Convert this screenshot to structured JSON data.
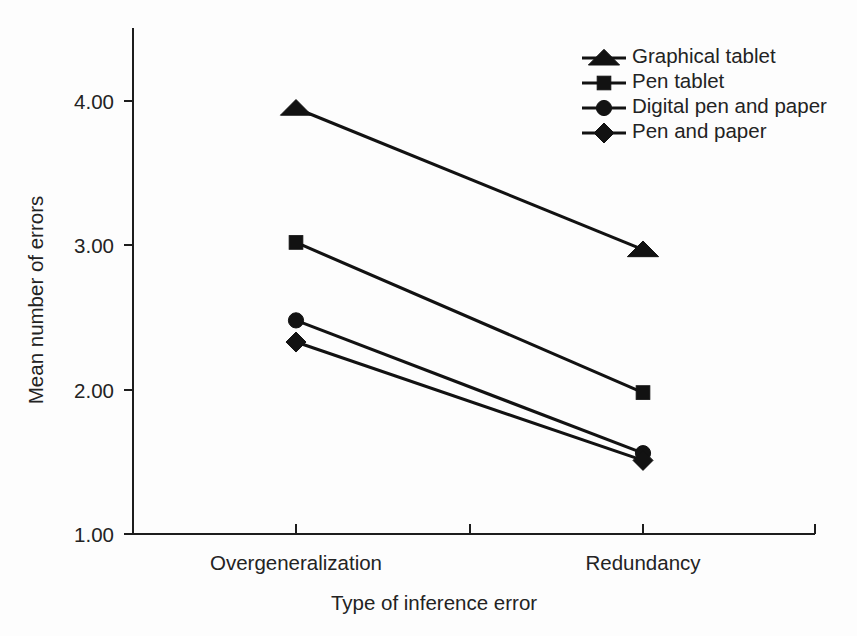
{
  "chart_data": {
    "type": "line",
    "title": "",
    "xlabel": "Type of inference error",
    "ylabel": "Mean number of errors",
    "categories": [
      "Overgeneralization",
      "Redundancy"
    ],
    "ylim": [
      1.0,
      4.3
    ],
    "yticks": [
      "1.00",
      "2.00",
      "3.00",
      "4.00"
    ],
    "ytick_values": [
      1.0,
      2.0,
      3.0,
      4.0
    ],
    "grid": false,
    "legend_position": "top-right",
    "series": [
      {
        "name": "Graphical tablet",
        "marker": "triangle",
        "values": [
          3.95,
          2.97
        ]
      },
      {
        "name": "Pen tablet",
        "marker": "square",
        "values": [
          3.02,
          1.98
        ]
      },
      {
        "name": "Digital pen and paper",
        "marker": "circle",
        "values": [
          2.48,
          1.56
        ]
      },
      {
        "name": "Pen and paper",
        "marker": "diamond",
        "values": [
          2.33,
          1.51
        ]
      }
    ],
    "colors": {
      "line": "#121212",
      "marker": "#121212",
      "axis": "#1d1d1d",
      "text": "#232323",
      "background": "#fdfdfd"
    }
  },
  "axes": {
    "y_title": "Mean number of errors",
    "x_title": "Type of inference error",
    "y_tick_0": "1.00",
    "y_tick_1": "2.00",
    "y_tick_2": "3.00",
    "y_tick_3": "4.00",
    "x_cat_0": "Overgeneralization",
    "x_cat_1": "Redundancy"
  },
  "legend": {
    "items": [
      {
        "label": "Graphical tablet"
      },
      {
        "label": "Pen tablet"
      },
      {
        "label": "Digital pen and paper"
      },
      {
        "label": "Pen and paper"
      }
    ]
  }
}
